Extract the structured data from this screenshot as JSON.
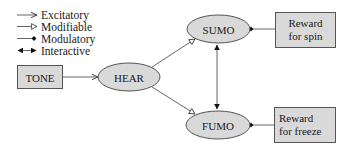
{
  "legend": {
    "items": [
      {
        "key": "excitatory",
        "label": "Excitatory",
        "marker": "arrow-icon"
      },
      {
        "key": "modifiable",
        "label": "Modifiable",
        "marker": "open-triangle-arrow-icon"
      },
      {
        "key": "modulatory",
        "label": "Modulatory",
        "marker": "diamond-dot-icon"
      },
      {
        "key": "interactive",
        "label": "Interactive",
        "marker": "double-arrow-icon"
      }
    ]
  },
  "nodes": {
    "tone": {
      "label": "TONE",
      "shape": "rectangle"
    },
    "hear": {
      "label": "HEAR",
      "shape": "ellipse"
    },
    "sumo": {
      "label": "SUMO",
      "shape": "ellipse"
    },
    "fumo": {
      "label": "FUMO",
      "shape": "ellipse"
    },
    "reward_spin": {
      "lines": [
        "Reward",
        "for spin"
      ],
      "shape": "rectangle"
    },
    "reward_freeze": {
      "lines": [
        "Reward",
        "for freeze"
      ],
      "shape": "rectangle"
    }
  },
  "edges": [
    {
      "from": "TONE",
      "to": "HEAR",
      "type": "excitatory"
    },
    {
      "from": "HEAR",
      "to": "SUMO",
      "type": "modifiable"
    },
    {
      "from": "HEAR",
      "to": "FUMO",
      "type": "modifiable"
    },
    {
      "from": "SUMO",
      "to": "FUMO",
      "type": "interactive"
    },
    {
      "from": "Reward for spin",
      "to": "SUMO",
      "type": "modulatory"
    },
    {
      "from": "Reward for freeze",
      "to": "FUMO",
      "type": "modulatory"
    }
  ],
  "colors": {
    "fill": "#d9d9d9",
    "stroke": "#555555",
    "line": "#666666",
    "marker": "#111111"
  }
}
